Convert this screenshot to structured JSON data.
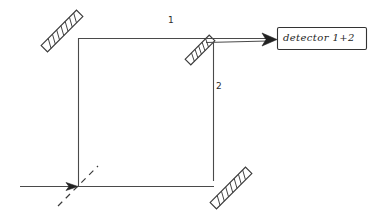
{
  "figure": {
    "background_color": "#ffffff",
    "line_color": "#3a3a3a",
    "width": 376,
    "height": 221
  },
  "labels": {
    "path_1": "1",
    "path_2": "2"
  },
  "detector": {
    "label": "detector 1+2",
    "box": {
      "x": 277,
      "y": 27,
      "width": 90,
      "height": 23
    }
  },
  "components": [
    {
      "name": "input-beam",
      "type": "arrow",
      "from": {
        "x": 20,
        "y": 186
      },
      "to": {
        "x": 78,
        "y": 186
      },
      "direction": "right"
    },
    {
      "name": "beam-splitter-input",
      "type": "dashed-splitter",
      "center": {
        "x": 78,
        "y": 186
      },
      "angle_deg": -45,
      "length": 55
    },
    {
      "name": "mirror-top-left",
      "type": "mirror",
      "center": {
        "x": 62,
        "y": 31
      },
      "angle_deg": -45,
      "length": 50,
      "thickness": 9
    },
    {
      "name": "mirror-bottom-right",
      "type": "mirror",
      "center": {
        "x": 230,
        "y": 187
      },
      "angle_deg": -45,
      "length": 50,
      "thickness": 9
    },
    {
      "name": "beam-splitter-output",
      "type": "mirror",
      "center": {
        "x": 199,
        "y": 50
      },
      "angle_deg": -45,
      "length": 34,
      "thickness": 8
    },
    {
      "name": "beam-path-1-top",
      "type": "line",
      "from": {
        "x": 78,
        "y": 38
      },
      "to": {
        "x": 213,
        "y": 38
      }
    },
    {
      "name": "beam-path-left-vertical",
      "type": "line",
      "from": {
        "x": 78,
        "y": 38
      },
      "to": {
        "x": 78,
        "y": 186
      }
    },
    {
      "name": "beam-path-2-right-vertical",
      "type": "line",
      "from": {
        "x": 213,
        "y": 42
      },
      "to": {
        "x": 213,
        "y": 180
      }
    },
    {
      "name": "beam-path-bottom",
      "type": "line",
      "from": {
        "x": 78,
        "y": 186
      },
      "to": {
        "x": 213,
        "y": 186
      }
    },
    {
      "name": "output-beam-to-detector",
      "type": "arrow",
      "from": {
        "x": 205,
        "y": 41
      },
      "to": {
        "x": 277,
        "y": 39
      },
      "direction": "right"
    }
  ]
}
